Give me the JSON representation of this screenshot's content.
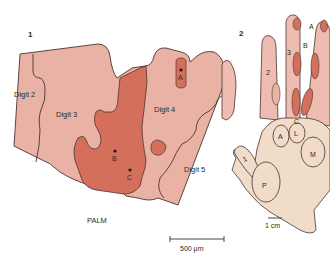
{
  "panel1": {
    "number": "1",
    "regions": {
      "digit2": "Digit 2",
      "digit3": "Digit 3",
      "digit4": "Digit 4",
      "digit5": "Digit 5",
      "palm": "PALM"
    },
    "points": {
      "a": "A",
      "b": "B",
      "c": "C"
    },
    "scale_bar": "500 μm"
  },
  "panel2": {
    "number": "2",
    "finger_numbers": {
      "f1": "1",
      "f2": "2",
      "f3": "3"
    },
    "markers": {
      "a": "A",
      "b": "B",
      "c": "C"
    },
    "palm_pads": {
      "p": "P",
      "a": "A",
      "l": "L",
      "m": "M"
    },
    "scale_bar": "1 cm"
  },
  "colors": {
    "light_region": "#eab2a4",
    "dark_region": "#d46f5c",
    "outline": "#4a3430",
    "hand_skin": "#f0dcc8",
    "finger_pink": "#eebcb0"
  }
}
